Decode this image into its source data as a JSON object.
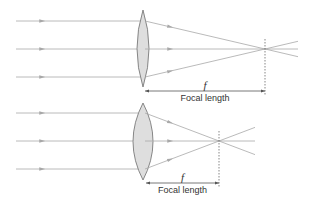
{
  "colors": {
    "ray": "#a8a8a8",
    "lens_fill": "#dedede",
    "lens_stroke": "#7a7a7a",
    "text": "#333333",
    "dimension": "#555555"
  },
  "diagrams": [
    {
      "name": "weak-lens",
      "lens": {
        "cx": 143,
        "top": 10,
        "bottom": 87,
        "half_width": 6
      },
      "rays_y": [
        21,
        49,
        77
      ],
      "ray_start_x": 16,
      "focal_point": {
        "x": 265,
        "y": 49
      },
      "ray_end_x": 298,
      "symbol": "f",
      "label": "Focal length",
      "dim_y": 91,
      "dim_x1": 145,
      "symbol_y": 80,
      "label_y": 94
    },
    {
      "name": "strong-lens",
      "lens": {
        "cx": 143,
        "top": 103,
        "bottom": 180,
        "half_width": 10
      },
      "rays_y": [
        113,
        141,
        169
      ],
      "ray_start_x": 16,
      "focal_point": {
        "x": 219,
        "y": 141
      },
      "ray_end_x": 255,
      "symbol": "f",
      "label": "Focal length",
      "dim_y": 183,
      "dim_x1": 146,
      "symbol_y": 172,
      "label_y": 186
    }
  ]
}
